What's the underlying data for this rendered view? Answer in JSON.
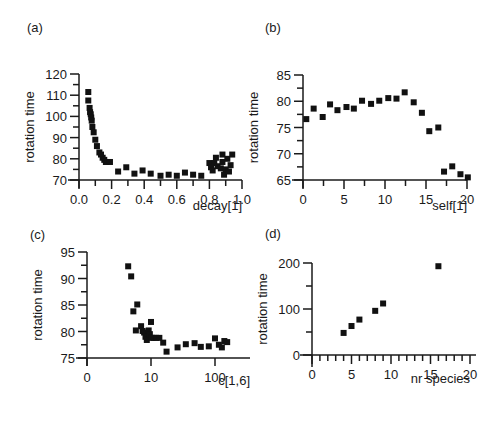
{
  "chart_data": [
    {
      "panel": "(a)",
      "type": "scatter",
      "xlabel": "decay[1]",
      "ylabel": "rotation time",
      "xlim": [
        0.0,
        1.0
      ],
      "ylim": [
        70,
        120
      ],
      "xticks": [
        "0.0",
        "0.2",
        "0.4",
        "0.6",
        "0.8",
        "1.0"
      ],
      "yticks": [
        "70",
        "80",
        "90",
        "100",
        "110",
        "120"
      ],
      "grid": false,
      "points": [
        [
          0.057,
          111.5
        ],
        [
          0.057,
          107.5
        ],
        [
          0.065,
          104
        ],
        [
          0.068,
          102
        ],
        [
          0.072,
          101
        ],
        [
          0.075,
          99.5
        ],
        [
          0.078,
          98
        ],
        [
          0.082,
          95
        ],
        [
          0.09,
          92.5
        ],
        [
          0.1,
          89
        ],
        [
          0.11,
          86
        ],
        [
          0.125,
          83
        ],
        [
          0.135,
          82
        ],
        [
          0.145,
          80.5
        ],
        [
          0.155,
          79.5
        ],
        [
          0.165,
          78.5
        ],
        [
          0.19,
          78.5
        ],
        [
          0.24,
          74
        ],
        [
          0.29,
          76
        ],
        [
          0.34,
          73
        ],
        [
          0.39,
          74.5
        ],
        [
          0.44,
          73
        ],
        [
          0.5,
          72
        ],
        [
          0.55,
          72.5
        ],
        [
          0.6,
          72
        ],
        [
          0.65,
          73.5
        ],
        [
          0.7,
          72.5
        ],
        [
          0.75,
          72
        ],
        [
          0.8,
          78
        ],
        [
          0.81,
          76
        ],
        [
          0.82,
          74.5
        ],
        [
          0.83,
          78
        ],
        [
          0.84,
          80.5
        ],
        [
          0.85,
          76.5
        ],
        [
          0.87,
          75.5
        ],
        [
          0.88,
          82
        ],
        [
          0.88,
          78.5
        ],
        [
          0.89,
          72.5
        ],
        [
          0.9,
          75
        ],
        [
          0.91,
          80
        ],
        [
          0.92,
          74
        ],
        [
          0.93,
          77
        ],
        [
          0.94,
          82
        ]
      ]
    },
    {
      "panel": "(b)",
      "type": "scatter",
      "xlabel": "self[1]",
      "ylabel": "rotation time",
      "xlim": [
        0,
        20
      ],
      "ylim": [
        65,
        85
      ],
      "xticks": [
        "0",
        "5",
        "10",
        "15",
        "20"
      ],
      "yticks": [
        "65",
        "70",
        "75",
        "80",
        "85"
      ],
      "grid": false,
      "points": [
        [
          0.4,
          76.6
        ],
        [
          1.3,
          78.6
        ],
        [
          2.4,
          77.0
        ],
        [
          3.3,
          79.4
        ],
        [
          4.2,
          78.3
        ],
        [
          5.3,
          78.9
        ],
        [
          6.2,
          78.6
        ],
        [
          7.2,
          80.1
        ],
        [
          8.3,
          79.5
        ],
        [
          9.3,
          80.1
        ],
        [
          10.4,
          80.6
        ],
        [
          11.4,
          80.5
        ],
        [
          12.4,
          81.7
        ],
        [
          13.5,
          79.8
        ],
        [
          14.5,
          77.8
        ],
        [
          15.4,
          74.3
        ],
        [
          16.5,
          75.0
        ],
        [
          17.2,
          66.6
        ],
        [
          18.2,
          67.6
        ],
        [
          19.2,
          66.1
        ],
        [
          20.1,
          65.5
        ]
      ]
    },
    {
      "panel": "(c)",
      "type": "scatter",
      "xlabel": "c[1,6]",
      "ylabel": "rotation time",
      "xscale": "log",
      "xticks": [
        "0",
        "10",
        "100"
      ],
      "yticks": [
        "75",
        "80",
        "85",
        "90",
        "95"
      ],
      "ylim": [
        75,
        95
      ],
      "grid": false,
      "points": [
        [
          4.4,
          92.3
        ],
        [
          4.9,
          90.4
        ],
        [
          5.3,
          83.8
        ],
        [
          6.1,
          85.1
        ],
        [
          5.8,
          80.2
        ],
        [
          7.0,
          81.0
        ],
        [
          7.4,
          80.1
        ],
        [
          7.8,
          79.8
        ],
        [
          8.2,
          79.0
        ],
        [
          8.6,
          78.4
        ],
        [
          9.2,
          80.2
        ],
        [
          9.6,
          79.5
        ],
        [
          10.0,
          81.8
        ],
        [
          10.3,
          78.8
        ],
        [
          11.0,
          78.8
        ],
        [
          12.0,
          78.8
        ],
        [
          13.5,
          78.8
        ],
        [
          15.5,
          77.9
        ],
        [
          17.5,
          76.2
        ],
        [
          26,
          77.0
        ],
        [
          35,
          77.6
        ],
        [
          48,
          77.8
        ],
        [
          60,
          77.1
        ],
        [
          80,
          77.2
        ],
        [
          100,
          78.7
        ],
        [
          115,
          77.5
        ],
        [
          128,
          77.0
        ],
        [
          140,
          78.2
        ],
        [
          155,
          78.0
        ]
      ]
    },
    {
      "panel": "(d)",
      "type": "scatter",
      "xlabel": "nr species",
      "ylabel": "rotation time",
      "xlim": [
        0,
        20
      ],
      "ylim": [
        0,
        200
      ],
      "xticks": [
        "0",
        "5",
        "10",
        "15",
        "20"
      ],
      "yticks": [
        "0",
        "100",
        "200"
      ],
      "grid": false,
      "points": [
        [
          4,
          48
        ],
        [
          5,
          63
        ],
        [
          6,
          77
        ],
        [
          8,
          96
        ],
        [
          9,
          112
        ],
        [
          16,
          193
        ]
      ]
    }
  ],
  "panels": {
    "a": {
      "label": "(a)",
      "xlabel": "decay[1]",
      "ylabel": "rotation time"
    },
    "b": {
      "label": "(b)",
      "xlabel": "self[1]",
      "ylabel": "rotation time"
    },
    "c": {
      "label": "(c)",
      "xlabel": "c[1,6]",
      "ylabel": "rotation time"
    },
    "d": {
      "label": "(d)",
      "xlabel": "nr species",
      "ylabel": "rotation time"
    }
  }
}
